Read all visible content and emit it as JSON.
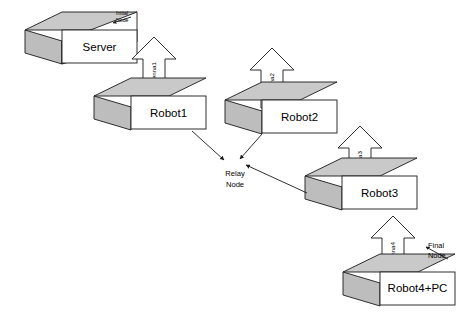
{
  "diagram": {
    "colors": {
      "box_front_fill": "#ffffff",
      "box_top_fill": "#c9c9c9",
      "box_side_fill": "#bdbdbd",
      "outline": "#1a1a1a",
      "antenna_fill": "#ffffff",
      "arrow_stroke": "#1a1a1a",
      "background": "#ffffff"
    },
    "nodes": [
      {
        "id": "server",
        "label": "Server",
        "antenna": null,
        "badge": "Initial Node"
      },
      {
        "id": "robot1",
        "label": "Robot1",
        "antenna": "antenna1",
        "badge": null
      },
      {
        "id": "robot2",
        "label": "Robot2",
        "antenna": "antenna2",
        "badge": null
      },
      {
        "id": "robot3",
        "label": "Robot3",
        "antenna": "antenna3",
        "badge": null
      },
      {
        "id": "robot4pc",
        "label": "Robot4+PC",
        "antenna": "antenna4",
        "badge": "Final Node"
      }
    ],
    "relay": {
      "label_line1": "Relay",
      "label_line2": "Node",
      "incoming_count": 3,
      "sources": [
        "robot1",
        "robot2",
        "robot3"
      ]
    },
    "badges": {
      "initial_line1": "Initial",
      "initial_line2": "Node",
      "final_line1": "Final",
      "final_line2": "Node"
    },
    "antennas": {
      "a1": "antenna1",
      "a2": "antenna2",
      "a3": "antenna3",
      "a4": "antenna4"
    },
    "labels": {
      "server": "Server",
      "robot1": "Robot1",
      "robot2": "Robot2",
      "robot3": "Robot3",
      "robot4pc": "Robot4+PC"
    }
  }
}
